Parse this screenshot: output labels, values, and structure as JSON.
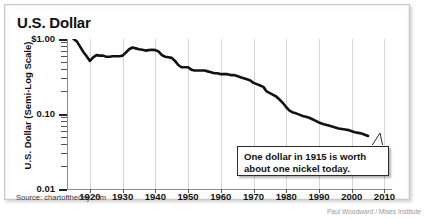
{
  "title": "U.S. Dollar",
  "source": "Source: chartoftheday.com",
  "credit": "Paul Woodward / Mises Institute",
  "callout": {
    "line1": "One dollar in 1915 is worth",
    "line2": "about one nickel today."
  },
  "chart_data": {
    "type": "line",
    "title": "U.S. Dollar",
    "xlabel": "",
    "ylabel": "U.S. Dollar (Semi-Log Scale)",
    "yscale": "log",
    "ylim": [
      0.01,
      1.0
    ],
    "xlim": [
      1913,
      2012
    ],
    "grid": "vertical",
    "legend": "none",
    "ytick_labels": [
      "$1.00",
      "0.10",
      "0.01"
    ],
    "ytick_values": [
      1.0,
      0.1,
      0.01
    ],
    "xtick_labels": [
      "1920",
      "1930",
      "1940",
      "1950",
      "1960",
      "1970",
      "1980",
      "1990",
      "2000",
      "2010"
    ],
    "xtick_values": [
      1920,
      1930,
      1940,
      1950,
      1960,
      1970,
      1980,
      1990,
      2000,
      2010
    ],
    "annotation": "One dollar in 1915 is worth about one nickel today.",
    "series": [
      {
        "name": "Purchasing power of the U.S. dollar",
        "x": [
          1915,
          1916,
          1917,
          1918,
          1919,
          1920,
          1921,
          1922,
          1923,
          1924,
          1925,
          1926,
          1927,
          1928,
          1929,
          1930,
          1931,
          1932,
          1933,
          1934,
          1935,
          1936,
          1937,
          1938,
          1939,
          1940,
          1941,
          1942,
          1943,
          1944,
          1945,
          1946,
          1947,
          1948,
          1949,
          1950,
          1951,
          1952,
          1953,
          1954,
          1955,
          1956,
          1957,
          1958,
          1959,
          1960,
          1961,
          1962,
          1963,
          1964,
          1965,
          1966,
          1967,
          1968,
          1969,
          1970,
          1971,
          1972,
          1973,
          1974,
          1975,
          1976,
          1977,
          1978,
          1979,
          1980,
          1981,
          1982,
          1983,
          1984,
          1985,
          1986,
          1987,
          1988,
          1989,
          1990,
          1991,
          1992,
          1993,
          1994,
          1995,
          1996,
          1997,
          1998,
          1999,
          2000,
          2001,
          2002,
          2003,
          2004,
          2005
        ],
        "y": [
          1.0,
          0.93,
          0.79,
          0.67,
          0.59,
          0.51,
          0.57,
          0.61,
          0.6,
          0.6,
          0.58,
          0.58,
          0.59,
          0.59,
          0.59,
          0.6,
          0.66,
          0.73,
          0.77,
          0.75,
          0.73,
          0.72,
          0.7,
          0.71,
          0.72,
          0.71,
          0.68,
          0.61,
          0.58,
          0.57,
          0.56,
          0.51,
          0.45,
          0.42,
          0.42,
          0.42,
          0.39,
          0.38,
          0.38,
          0.38,
          0.38,
          0.37,
          0.36,
          0.35,
          0.35,
          0.34,
          0.34,
          0.34,
          0.33,
          0.33,
          0.32,
          0.31,
          0.3,
          0.29,
          0.28,
          0.26,
          0.25,
          0.24,
          0.23,
          0.2,
          0.19,
          0.18,
          0.17,
          0.155,
          0.14,
          0.123,
          0.111,
          0.105,
          0.102,
          0.098,
          0.094,
          0.092,
          0.089,
          0.085,
          0.081,
          0.077,
          0.074,
          0.072,
          0.07,
          0.068,
          0.066,
          0.064,
          0.063,
          0.062,
          0.061,
          0.059,
          0.057,
          0.056,
          0.055,
          0.053,
          0.051
        ]
      }
    ]
  }
}
